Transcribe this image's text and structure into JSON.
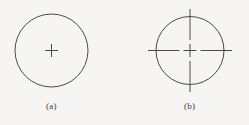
{
  "figure": {
    "background_color": "#f6f5f3",
    "stroke_color": "#4a4a4a",
    "panels": [
      {
        "key": "a",
        "caption": "(a)",
        "description": "circle-with-center-plus",
        "circle": {
          "cx": 51.5,
          "cy": 50.5,
          "r": 36.5,
          "stroke_width": 1.0
        },
        "center_mark": {
          "type": "plus",
          "cx": 51.5,
          "cy": 50.5,
          "arm_length": 6.5,
          "stroke_width": 1.0
        }
      },
      {
        "key": "b",
        "caption": "(b)",
        "description": "circle-with-crosshair-centerlines",
        "circle": {
          "cx": 190.0,
          "cy": 50.5,
          "r": 34.0,
          "stroke_width": 1.0
        },
        "center_mark": {
          "type": "plus",
          "cx": 190.0,
          "cy": 50.5,
          "arm_length": 6.5,
          "stroke_width": 1.0
        },
        "centerlines": {
          "style": "centerline-dashed",
          "horizontal": {
            "x1": 148.0,
            "x2": 232.0,
            "y": 50.5,
            "gap": 4.0,
            "inner_dash_half": 6.5
          },
          "vertical": {
            "y1": 9.0,
            "y2": 92.0,
            "x": 190.0,
            "gap": 4.0,
            "inner_dash_half": 6.5
          }
        }
      }
    ]
  }
}
